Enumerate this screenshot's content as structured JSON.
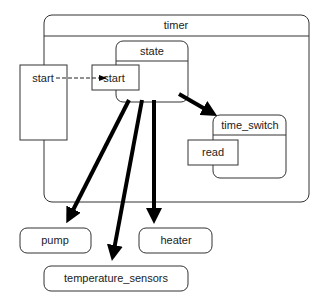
{
  "diagram": {
    "type": "statechart",
    "nodes": {
      "timer": {
        "label": "timer"
      },
      "state": {
        "label": "state"
      },
      "outer_start": {
        "label": "start"
      },
      "inner_start": {
        "label": "start"
      },
      "time_switch": {
        "label": "time_switch"
      },
      "read": {
        "label": "read"
      },
      "pump": {
        "label": "pump"
      },
      "heater": {
        "label": "heater"
      },
      "temperature_sensors": {
        "label": "temperature_sensors"
      }
    },
    "edges": [
      {
        "from": "outer_start",
        "to": "inner_start",
        "style": "dashed"
      },
      {
        "from": "state",
        "to": "time_switch",
        "style": "thick"
      },
      {
        "from": "state",
        "to": "pump",
        "style": "thick"
      },
      {
        "from": "state",
        "to": "temperature_sensors",
        "style": "thick"
      },
      {
        "from": "state",
        "to": "heater",
        "style": "thick"
      }
    ]
  },
  "colors": {
    "stroke": "#333333",
    "arrow": "#000000",
    "background": "#ffffff"
  }
}
